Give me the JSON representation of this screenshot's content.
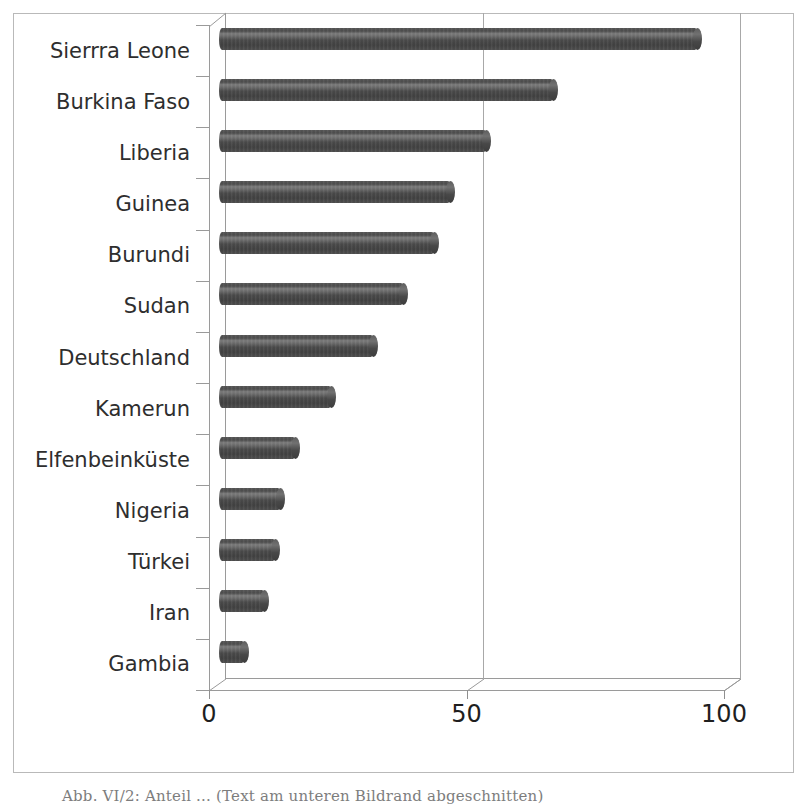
{
  "chart_data": {
    "type": "bar",
    "orientation": "horizontal",
    "title": "",
    "xlabel": "",
    "ylabel": "",
    "xlim": [
      0,
      105
    ],
    "xticks": [
      0,
      50,
      100
    ],
    "xtick_labels": [
      "0",
      "50",
      "100"
    ],
    "grid": true,
    "gridlines_at": [
      50,
      100
    ],
    "legend": "none",
    "style": "3d-cylinder-bars",
    "bar_color": "#4a4a4a",
    "categories": [
      "Sierrra Leone",
      "Burkina Faso",
      "Liberia",
      "Guinea",
      "Burundi",
      "Sudan",
      "Deutschland",
      "Kamerun",
      "Elfenbeinküste",
      "Nigeria",
      "Türkei",
      "Iran",
      "Gambia"
    ],
    "values": [
      93,
      65,
      52,
      45,
      42,
      36,
      30,
      22,
      15,
      12,
      11,
      9,
      5
    ],
    "series": [
      {
        "name": "",
        "values": [
          93,
          65,
          52,
          45,
          42,
          36,
          30,
          22,
          15,
          12,
          11,
          9,
          5
        ]
      }
    ]
  },
  "figure": {
    "caption": "Abb. VI/2: Anteil ... (Text am unteren Bildrand abgeschnitten)"
  }
}
